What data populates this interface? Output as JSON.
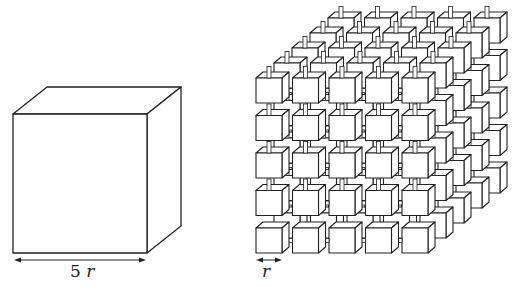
{
  "large_cube": {
    "label_number": "5",
    "label_var": "r",
    "front": {
      "x": 13,
      "y": 114,
      "w": 134,
      "h": 139
    },
    "depth": {
      "dx": 34,
      "dy": -27
    }
  },
  "small_cube_grid": {
    "label_var": "r",
    "rows": 5,
    "cols": 5,
    "layers": 5,
    "origin": {
      "x": 256,
      "y": 228
    },
    "cube": {
      "w": 26,
      "h": 25,
      "dx": 7,
      "dy": -6
    },
    "pitch": {
      "x": 36.5,
      "y": 37.5
    },
    "layer_offset": {
      "dx": 18,
      "dy": -15
    }
  },
  "colors": {
    "stroke": "#222222",
    "fill": "#ffffff"
  }
}
